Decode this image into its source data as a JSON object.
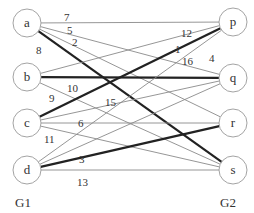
{
  "graph": {
    "type": "bipartite",
    "left_label": "G1",
    "right_label": "G2",
    "left_nodes": [
      {
        "id": "a",
        "x": 27,
        "y": 23
      },
      {
        "id": "b",
        "x": 27,
        "y": 77
      },
      {
        "id": "c",
        "x": 27,
        "y": 123
      },
      {
        "id": "d",
        "x": 27,
        "y": 170
      }
    ],
    "right_nodes": [
      {
        "id": "p",
        "x": 233,
        "y": 22
      },
      {
        "id": "q",
        "x": 233,
        "y": 78
      },
      {
        "id": "r",
        "x": 233,
        "y": 123
      },
      {
        "id": "s",
        "x": 233,
        "y": 170
      }
    ],
    "edges": [
      {
        "from": "a",
        "to": "p",
        "weight": "7",
        "bold": false,
        "lx": 64,
        "ly": 21
      },
      {
        "from": "a",
        "to": "q",
        "weight": "5",
        "bold": false,
        "lx": 67,
        "ly": 34
      },
      {
        "from": "a",
        "to": "r",
        "weight": "2",
        "bold": false,
        "lx": 72,
        "ly": 46
      },
      {
        "from": "a",
        "to": "s",
        "weight": "8",
        "bold": true,
        "lx": 36,
        "ly": 54
      },
      {
        "from": "b",
        "to": "p",
        "weight": "12",
        "bold": false,
        "lx": 181,
        "ly": 37
      },
      {
        "from": "b",
        "to": "q",
        "weight": "10",
        "bold": true,
        "lx": 67,
        "ly": 92
      },
      {
        "from": "b",
        "to": "s",
        "weight": "9",
        "bold": false,
        "lx": 49,
        "ly": 102
      },
      {
        "from": "c",
        "to": "p",
        "weight": "1",
        "bold": true,
        "lx": 175,
        "ly": 53
      },
      {
        "from": "c",
        "to": "q",
        "weight": "15",
        "bold": false,
        "lx": 105,
        "ly": 106
      },
      {
        "from": "c",
        "to": "r",
        "weight": "6",
        "bold": false,
        "lx": 78,
        "ly": 127
      },
      {
        "from": "c",
        "to": "s",
        "weight": "11",
        "bold": false,
        "lx": 44,
        "ly": 143
      },
      {
        "from": "d",
        "to": "p",
        "weight": "16",
        "bold": false,
        "lx": 182,
        "ly": 65
      },
      {
        "from": "d",
        "to": "q",
        "weight": "4",
        "bold": false,
        "lx": 209,
        "ly": 62
      },
      {
        "from": "d",
        "to": "r",
        "weight": "3",
        "bold": true,
        "lx": 79,
        "ly": 163
      },
      {
        "from": "d",
        "to": "s",
        "weight": "13",
        "bold": false,
        "lx": 77,
        "ly": 186
      }
    ]
  }
}
